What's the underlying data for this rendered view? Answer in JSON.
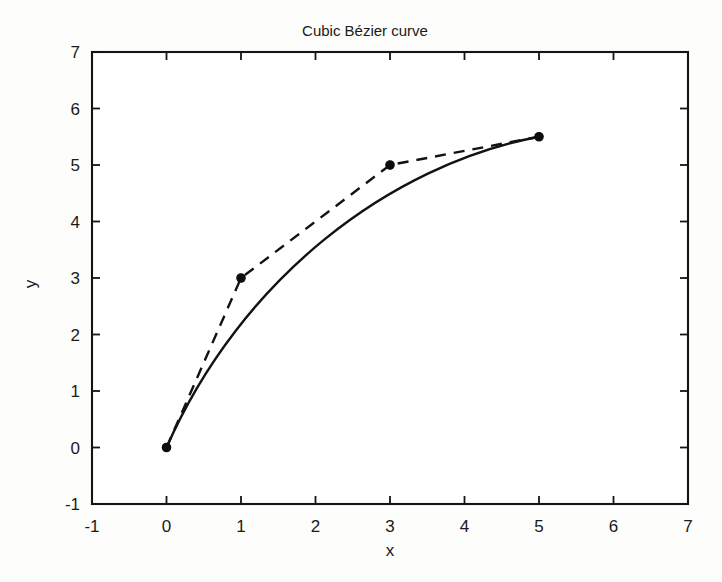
{
  "chart_data": {
    "type": "line",
    "title": "Cubic Bézier curve",
    "xlabel": "x",
    "ylabel": "y",
    "xlim": [
      -1,
      7
    ],
    "ylim": [
      -1,
      7
    ],
    "xticks": [
      "-1",
      "0",
      "1",
      "2",
      "3",
      "4",
      "5",
      "6",
      "7"
    ],
    "yticks": [
      "-1",
      "0",
      "1",
      "2",
      "3",
      "4",
      "5",
      "6",
      "7"
    ],
    "xtick_values": [
      -1,
      0,
      1,
      2,
      3,
      4,
      5,
      6,
      7
    ],
    "ytick_values": [
      -1,
      0,
      1,
      2,
      3,
      4,
      5,
      6,
      7
    ],
    "grid": false,
    "legend": "none",
    "series": [
      {
        "name": "control polygon",
        "style": "dashed",
        "marker": "point",
        "color": "#121212",
        "points": [
          {
            "x": 0,
            "y": 0
          },
          {
            "x": 1,
            "y": 3
          },
          {
            "x": 3,
            "y": 5
          },
          {
            "x": 5,
            "y": 5.5
          }
        ]
      },
      {
        "name": "cubic Bezier curve",
        "style": "solid",
        "marker": "none",
        "color": "#121212",
        "control_points": [
          {
            "x": 0,
            "y": 0
          },
          {
            "x": 1,
            "y": 3
          },
          {
            "x": 3,
            "y": 5
          },
          {
            "x": 5,
            "y": 5.5
          }
        ],
        "points": [
          {
            "x": 0,
            "y": 0
          },
          {
            "x": 0.1525,
            "y": 0.4353
          },
          {
            "x": 0.316,
            "y": 0.848
          },
          {
            "x": 0.4885,
            "y": 1.2393
          },
          {
            "x": 0.668,
            "y": 1.6104
          },
          {
            "x": 0.8525,
            "y": 1.9625
          },
          {
            "x": 1.04,
            "y": 2.2968
          },
          {
            "x": 1.2285,
            "y": 2.6145
          },
          {
            "x": 1.416,
            "y": 2.9168
          },
          {
            "x": 1.6005,
            "y": 3.2049
          },
          {
            "x": 1.78,
            "y": 3.48
          },
          {
            "x": 1.9525,
            "y": 3.7433
          },
          {
            "x": 2.116,
            "y": 3.996
          },
          {
            "x": 2.2685,
            "y": 4.2393
          },
          {
            "x": 2.408,
            "y": 4.4744
          },
          {
            "x": 2.5325,
            "y": 4.7025
          },
          {
            "x": 2.64,
            "y": 4.9248
          },
          {
            "x": 2.7285,
            "y": 5.1425
          },
          {
            "x": 2.796,
            "y": 5.3568
          },
          {
            "x": 2.8405,
            "y": 5.5689
          },
          {
            "x": 3.0,
            "y": 5.5
          },
          {
            "x": 3.5,
            "y": 5.3
          },
          {
            "x": 4.0,
            "y": 5.4
          },
          {
            "x": 4.5,
            "y": 5.45
          },
          {
            "x": 5,
            "y": 5.5
          }
        ]
      }
    ]
  }
}
